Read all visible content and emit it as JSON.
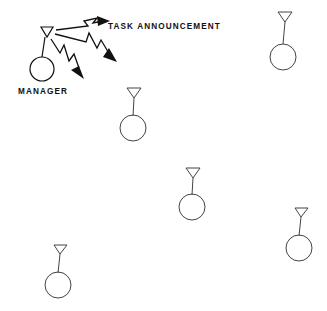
{
  "diagram": {
    "background_color": "#ffffff",
    "stroke_color": "#111111",
    "node_stroke_color": "#444444",
    "width": 327,
    "height": 311,
    "labels": {
      "task_announcement": "TASK ANNOUNCEMENT",
      "manager": "MANAGER"
    },
    "manager_node": {
      "name": "manager",
      "label": "MANAGER",
      "antenna_cx": 47,
      "antenna_top_y": 27,
      "antenna_half_width": 6,
      "antenna_tip_y": 37,
      "stem_bottom_y": 57,
      "circle_cx": 42,
      "circle_cy": 69,
      "circle_r": 12
    },
    "agent_nodes": [
      {
        "name": "agent-top-right",
        "antenna_cx": 285,
        "antenna_top_y": 12,
        "antenna_half_width": 6,
        "antenna_tip_y": 21,
        "stem_bottom_y": 44,
        "circle_cx": 283,
        "circle_cy": 57,
        "circle_r": 13
      },
      {
        "name": "agent-upper-middle",
        "antenna_cx": 134,
        "antenna_top_y": 88,
        "antenna_half_width": 6,
        "antenna_tip_y": 97,
        "stem_bottom_y": 116,
        "circle_cx": 133,
        "circle_cy": 128,
        "circle_r": 13
      },
      {
        "name": "agent-center",
        "antenna_cx": 193,
        "antenna_top_y": 168,
        "antenna_half_width": 6,
        "antenna_tip_y": 177,
        "stem_bottom_y": 193,
        "circle_cx": 192,
        "circle_cy": 207,
        "circle_r": 13
      },
      {
        "name": "agent-bottom-right",
        "antenna_cx": 301,
        "antenna_top_y": 208,
        "antenna_half_width": 6,
        "antenna_tip_y": 216,
        "stem_bottom_y": 235,
        "circle_cx": 299,
        "circle_cy": 248,
        "circle_r": 13
      },
      {
        "name": "agent-bottom-left",
        "antenna_cx": 60,
        "antenna_top_y": 245,
        "antenna_half_width": 6,
        "antenna_tip_y": 253,
        "stem_bottom_y": 272,
        "circle_cx": 58,
        "circle_cy": 285,
        "circle_r": 13
      }
    ],
    "broadcast_arrows": [
      {
        "name": "bolt-arrow-right",
        "direction": "east",
        "path": "M 56 30 L 88 26 L 84 21 L 97 18 L 93 23 L 104 21",
        "head": "104,21 93,17 94,25"
      },
      {
        "name": "bolt-arrow-east-southeast",
        "direction": "east-southeast",
        "path": "M 55 34 L 86 42 L 89 34 L 97 48 L 101 41 L 113 57",
        "head": "116,60 104,56 109,49"
      },
      {
        "name": "bolt-arrow-southeast",
        "direction": "southeast",
        "path": "M 51 39 L 60 53 L 64 46 L 69 61 L 74 55 L 80 71",
        "head": "82,76 71,69 78,65"
      }
    ]
  }
}
